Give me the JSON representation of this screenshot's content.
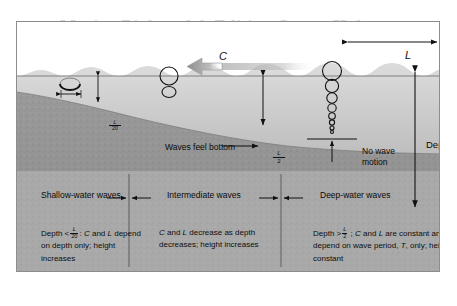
{
  "watermark_text": "Marine Biology 9th Edition Castro Huber",
  "figure": {
    "wave_speed_label": "C",
    "wavelength_label": "L",
    "depth_label": "Depth",
    "feel_bottom_label": "Waves feel bottom",
    "no_wave_motion_label": "No wave\nmotion",
    "depth_marker_shallow": {
      "numerator": "L",
      "denominator": "20"
    },
    "depth_marker_deep": {
      "numerator": "L",
      "denominator": "2"
    }
  },
  "zones": [
    {
      "name": "shallow",
      "label": "Shallow-water\nwaves"
    },
    {
      "name": "intermediate",
      "label": "Intermediate waves"
    },
    {
      "name": "deep",
      "label": "Deep-water\nwaves"
    }
  ],
  "descriptions": {
    "shallow": {
      "lead": "Depth <",
      "frac_num": "L",
      "frac_den": "20",
      "rest_1": ": ",
      "sym_c": "C",
      "rest_2": " and ",
      "sym_l": "L",
      "rest_3": " depend on depth only; height increases"
    },
    "intermediate": {
      "sym_c": "C",
      "mid": " and ",
      "sym_l": "L",
      "rest": " decrease as depth decreases; height increases"
    },
    "deep": {
      "lead": "Depth >",
      "frac_num": "L",
      "frac_den": "2",
      "rest_1": " ; ",
      "sym_c": "C",
      "rest_2": " and ",
      "sym_l": "L",
      "rest_3": " are constant and depend on wave period, ",
      "sym_t": "T",
      "rest_4": ", only; height constant"
    }
  },
  "colors": {
    "frame_border": "#8d8d8d",
    "sky": "#ffffff",
    "water_top": "#d9d9d9",
    "water_bottom": "#a9a9a9",
    "seafloor": "#8f8f8f",
    "panel": "#a8a8a8",
    "arrow_c": "#9a9a9a",
    "ink": "#111111"
  }
}
